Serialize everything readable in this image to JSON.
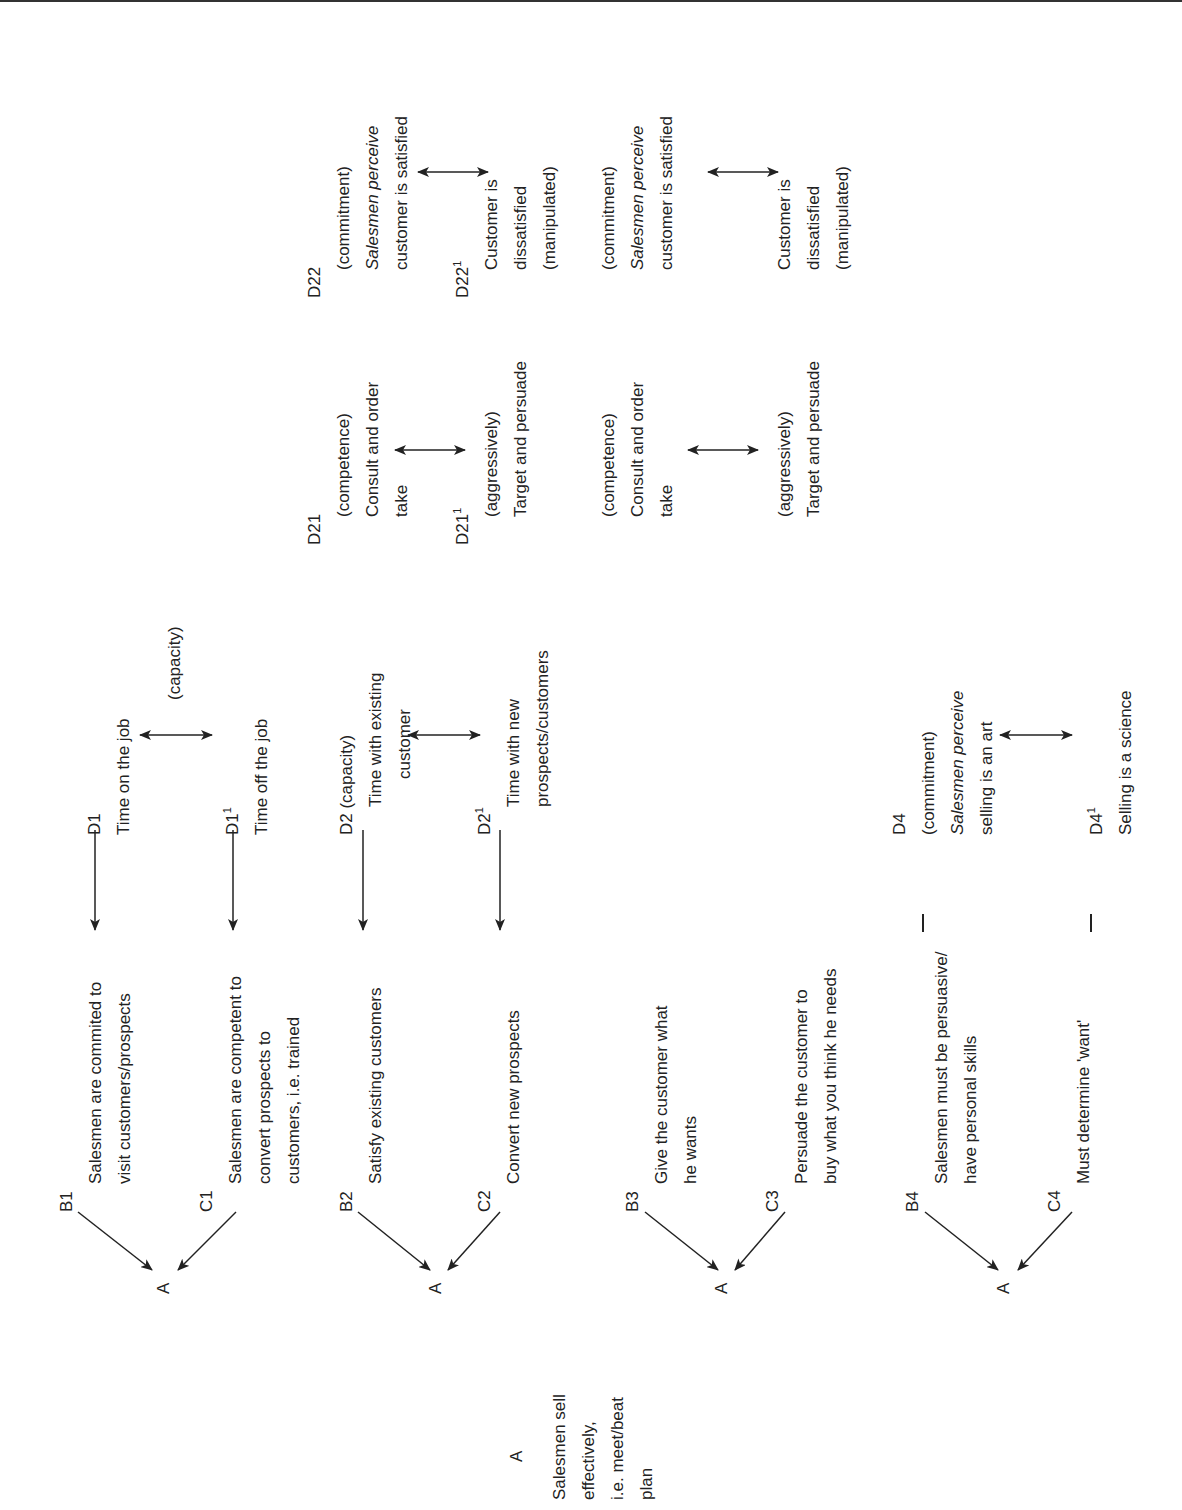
{
  "root": {
    "label": "A",
    "lines": [
      "Salesmen sell",
      "effectively,",
      "i.e. meet/beat",
      "plan"
    ]
  },
  "groups": [
    {
      "a": "A",
      "b": {
        "label": "B1",
        "lines": [
          "Salesmen are commited to",
          "visit customers/prospects"
        ]
      },
      "c": {
        "label": "C1",
        "lines": [
          "Salesmen are competent to",
          "convert prospects to",
          "customers, i.e. trained"
        ]
      },
      "d": {
        "label": "D1",
        "lines": [
          "Time on the job"
        ]
      },
      "d1": {
        "label": "D1",
        "sup": "1",
        "lines": [
          "Time off the job"
        ]
      },
      "note": "(capacity)"
    },
    {
      "a": "A",
      "b": {
        "label": "B2",
        "lines": [
          "Satisfy existing customers"
        ]
      },
      "c": {
        "label": "C2",
        "lines": [
          "Convert new prospects"
        ]
      },
      "d": {
        "label": "D2 (capacity)",
        "lines": [
          "Time with existing",
          "customer"
        ]
      },
      "d1": {
        "label": "D2",
        "sup": "1",
        "lines": [
          "Time with new",
          "prospects/customers"
        ]
      }
    },
    {
      "a": "A",
      "b": {
        "label": "B3",
        "lines": [
          "Give the customer what",
          "he wants"
        ]
      },
      "c": {
        "label": "C3",
        "lines": [
          "Persuade the customer to",
          "buy what you think he needs"
        ]
      }
    },
    {
      "a": "A",
      "b": {
        "label": "B4",
        "lines": [
          "Salesmen must be persuasive/",
          "have personal skills"
        ]
      },
      "c": {
        "label": "C4",
        "lines": [
          "Must determine 'want'"
        ]
      },
      "d": {
        "label": "D4",
        "lines": [
          "(commitment)",
          "Salesmen perceive",
          "selling is an art"
        ]
      },
      "d1": {
        "label": "D4",
        "sup": "1",
        "lines": [
          "Selling is a science"
        ]
      }
    }
  ],
  "d21_block_1": {
    "d21": {
      "label": "D21",
      "lines": [
        "(competence)",
        "Consult and order",
        "take"
      ]
    },
    "d21p": {
      "label": "D21",
      "sup": "1",
      "lines": [
        "(aggressively)",
        "Target and persuade"
      ]
    },
    "d22": {
      "label": "D22",
      "lines": [
        "(commitment)",
        "Salesmen perceive",
        "customer is satisfied"
      ]
    },
    "d22p": {
      "label": "D22",
      "sup": "1",
      "lines": [
        "Customer is",
        "dissatisfied",
        "(manipulated)"
      ]
    }
  },
  "d21_block_2": {
    "d21": {
      "lines": [
        "(competence)",
        "Consult and order",
        "take"
      ]
    },
    "d21p": {
      "lines": [
        "(aggressively)",
        "Target and persuade"
      ]
    },
    "d22": {
      "lines": [
        "(commitment)",
        "Salesmen perceive",
        "customer is satisfied"
      ]
    },
    "d22p": {
      "lines": [
        "Customer is",
        "dissatisfied",
        "(manipulated)"
      ]
    }
  }
}
